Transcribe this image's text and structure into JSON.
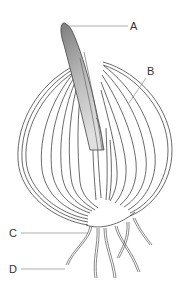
{
  "diagram": {
    "labels": [
      {
        "id": "A",
        "text": "A",
        "x": 130,
        "y": 21,
        "target": "shoot tip"
      },
      {
        "id": "B",
        "text": "B",
        "x": 147,
        "y": 66,
        "target": "fleshy scale leaves"
      },
      {
        "id": "C",
        "text": "C",
        "x": 9,
        "y": 228,
        "target": "stem base plate"
      },
      {
        "id": "D",
        "text": "D",
        "x": 9,
        "y": 264,
        "target": "adventitious roots"
      }
    ],
    "colors": {
      "outline": "#444444",
      "shoot_fill_dark": "#8a8a8a",
      "shoot_fill_light": "#d9d9d9",
      "leader": "#777777",
      "label_text": "#333333"
    }
  }
}
